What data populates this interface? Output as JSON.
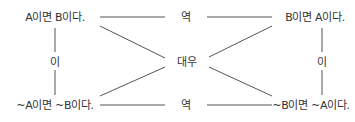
{
  "diagram": {
    "type": "logic-relations",
    "nodes": {
      "original": "A이면 B이다.",
      "converse": "B이면 A이다.",
      "inverse": "~A이면 ~B이다.",
      "contrapositive": "~B이면 ~A이다."
    },
    "relations": {
      "converse_top": "역",
      "converse_bottom": "역",
      "inverse_left": "이",
      "inverse_right": "이",
      "contrapositive_center": "대우"
    },
    "colors": {
      "text": "#333333",
      "line": "#555555",
      "background": "#ffffff"
    }
  }
}
